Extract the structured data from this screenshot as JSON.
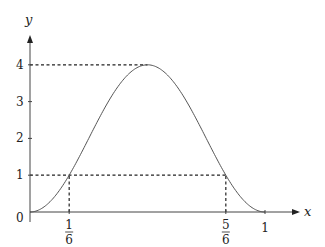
{
  "chart_data": {
    "type": "line",
    "title": "",
    "xlabel": "x",
    "ylabel": "y",
    "function": "y = 4 sin^2(pi x)",
    "xlim": [
      0,
      1
    ],
    "ylim": [
      0,
      4
    ],
    "grid": false,
    "legend": null,
    "x_ticks": [
      {
        "value": 0.1667,
        "num": "1",
        "den": "6"
      },
      {
        "value": 0.8333,
        "num": "5",
        "den": "6"
      },
      {
        "value": 1,
        "label": "1"
      }
    ],
    "y_ticks": [
      {
        "value": 1,
        "label": "1"
      },
      {
        "value": 2,
        "label": "2"
      },
      {
        "value": 3,
        "label": "3"
      },
      {
        "value": 4,
        "label": "4"
      }
    ],
    "origin_label": "0",
    "points": [
      {
        "x": 0,
        "y": 0
      },
      {
        "x": 0.1667,
        "y": 1
      },
      {
        "x": 0.5,
        "y": 4
      },
      {
        "x": 0.8333,
        "y": 1
      },
      {
        "x": 1,
        "y": 0
      }
    ],
    "annotations": [
      {
        "type": "dashed-h",
        "y": 4,
        "x_from": 0,
        "x_to": 0.5
      },
      {
        "type": "dashed-h",
        "y": 1,
        "x_from": 0,
        "x_to": 0.8333
      },
      {
        "type": "dashed-v",
        "x": 0.1667,
        "y_from": 0,
        "y_to": 1
      },
      {
        "type": "dashed-v",
        "x": 0.8333,
        "y_from": 0,
        "y_to": 1
      }
    ]
  }
}
